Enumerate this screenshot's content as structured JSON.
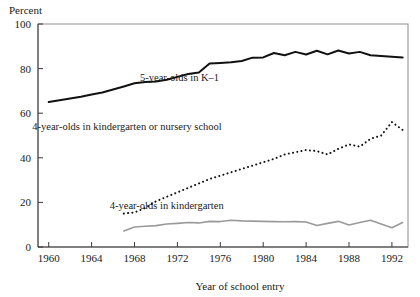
{
  "figure": {
    "ylabel": "Percent",
    "xlabel": "Year of school entry"
  },
  "labels": {
    "series1": "5-year-olds in K–1",
    "series2": "4-year-olds in kindergarten or nursery school",
    "series3": "4-year-olds in kindergarten"
  },
  "chart_data": {
    "type": "line",
    "title": "",
    "xlabel": "Year of school entry",
    "ylabel": "Percent",
    "xlim": [
      1959,
      1993.5
    ],
    "ylim": [
      0,
      100
    ],
    "xticks": [
      1960,
      1964,
      1968,
      1972,
      1976,
      1980,
      1984,
      1988,
      1992
    ],
    "xticklabels": [
      "1960",
      "1964",
      "1968",
      "1972",
      "1976",
      "1980",
      "1984",
      "1988",
      "1992"
    ],
    "yticks": [
      0,
      20,
      40,
      60,
      80,
      100
    ],
    "yticklabels": [
      "0",
      "20",
      "40",
      "60",
      "80",
      "100"
    ],
    "grid": false,
    "legend": "inline-annotations",
    "annotations": [
      {
        "text": "5-year-olds in K–1",
        "x": 1972.2,
        "y": 74.5
      },
      {
        "text": "4-year-olds in kindergarten or nursery school",
        "x": 1967.3,
        "y": 52.5
      },
      {
        "text": "4-year-olds in kindergarten",
        "x": 1971.0,
        "y": 17.0
      }
    ],
    "series": [
      {
        "name": "5-year-olds in K–1",
        "style": "solid",
        "color": "#111111",
        "x": [
          1960,
          1961,
          1962,
          1963,
          1964,
          1965,
          1966,
          1967,
          1968,
          1969,
          1970,
          1971,
          1972,
          1973,
          1974,
          1975,
          1976,
          1977,
          1978,
          1979,
          1980,
          1981,
          1982,
          1983,
          1984,
          1985,
          1986,
          1987,
          1988,
          1989,
          1990,
          1991,
          1992,
          1993
        ],
        "values": [
          65.0,
          65.8,
          66.6,
          67.4,
          68.4,
          69.3,
          70.6,
          72.0,
          73.4,
          74.0,
          74.2,
          75.0,
          76.3,
          77.6,
          78.2,
          82.3,
          82.5,
          82.8,
          83.4,
          84.9,
          85.0,
          87.0,
          86.0,
          87.5,
          86.3,
          88.0,
          86.4,
          88.1,
          86.8,
          87.5,
          86.0,
          85.6,
          85.3,
          85.0
        ]
      },
      {
        "name": "4-year-olds in kindergarten or nursery school",
        "style": "dotted",
        "color": "#111111",
        "x": [
          1967,
          1968,
          1969,
          1970,
          1971,
          1972,
          1973,
          1974,
          1975,
          1976,
          1977,
          1978,
          1979,
          1980,
          1981,
          1982,
          1983,
          1984,
          1985,
          1986,
          1987,
          1988,
          1989,
          1990,
          1991,
          1992,
          1993
        ],
        "values": [
          15.0,
          15.5,
          17.5,
          20.5,
          22.5,
          24.5,
          26.5,
          28.5,
          30.5,
          32.0,
          33.5,
          35.0,
          36.5,
          38.0,
          39.5,
          41.5,
          42.5,
          43.5,
          43.0,
          41.5,
          44.0,
          46.0,
          45.0,
          48.5,
          50.0,
          56.0,
          52.5
        ]
      },
      {
        "name": "4-year-olds in kindergarten",
        "style": "solid",
        "color": "#9a9a9a",
        "x": [
          1967,
          1968,
          1969,
          1970,
          1971,
          1972,
          1973,
          1974,
          1975,
          1976,
          1977,
          1978,
          1979,
          1980,
          1981,
          1982,
          1983,
          1984,
          1985,
          1986,
          1987,
          1988,
          1989,
          1990,
          1991,
          1992,
          1993
        ],
        "values": [
          7.2,
          9.0,
          9.3,
          9.6,
          10.3,
          10.6,
          11.0,
          10.8,
          11.5,
          11.4,
          12.0,
          11.7,
          11.6,
          11.5,
          11.4,
          11.3,
          11.4,
          11.2,
          9.6,
          10.6,
          11.5,
          9.9,
          11.0,
          12.0,
          10.3,
          8.6,
          11.0
        ]
      }
    ]
  }
}
